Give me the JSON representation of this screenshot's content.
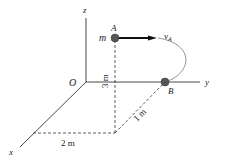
{
  "diagram": {
    "axes": {
      "x": "x",
      "y": "y",
      "z": "z",
      "origin": "O"
    },
    "points": {
      "A": {
        "label": "A",
        "mass_label": "m"
      },
      "B": {
        "label": "B"
      }
    },
    "velocity": {
      "symbol": "v",
      "subscript": "A"
    },
    "dimensions": {
      "height": "3 m",
      "x_offset": "2 m",
      "y_offset": "1 m"
    },
    "colors": {
      "line": "#333333",
      "point": "#555555",
      "curve": "#888888"
    }
  }
}
